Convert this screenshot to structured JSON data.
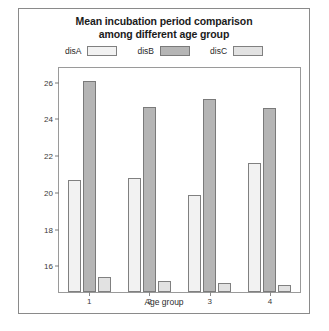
{
  "chart_data": {
    "type": "bar",
    "title": "Mean incubation period comparison among different age group",
    "title_lines": [
      "Mean incubation period comparison",
      "among different age group"
    ],
    "xlabel": "Age group",
    "ylabel": "Mean incubation period (weeks)",
    "categories": [
      "1",
      "2",
      "3",
      "4"
    ],
    "ylim": [
      14.6,
      26.8
    ],
    "yticks": [
      16,
      18,
      20,
      22,
      24,
      26
    ],
    "ytick_labels": [
      "16",
      "18",
      "20",
      "22",
      "24",
      "26"
    ],
    "grid": false,
    "legend_position": "top",
    "series": [
      {
        "name": "disA",
        "color": "#f2f2f2",
        "edge_color": "#808080",
        "values": [
          20.7,
          20.8,
          19.9,
          21.6
        ]
      },
      {
        "name": "disB",
        "color": "#b5b5b5",
        "edge_color": "#7a7a7a",
        "values": [
          26.1,
          24.7,
          25.1,
          24.6
        ]
      },
      {
        "name": "disC",
        "color": "#e2e2e2",
        "edge_color": "#808080",
        "values": [
          15.4,
          15.2,
          15.1,
          15.0
        ]
      }
    ]
  },
  "figure": {
    "background": "#ffffff",
    "border_color": "#8a8a8a",
    "axes_border_color": "#9a9a9a"
  }
}
